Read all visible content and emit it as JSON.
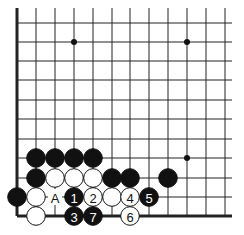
{
  "board": {
    "cols_x": [
      17,
      36,
      55,
      74,
      93,
      112,
      130,
      149,
      168,
      187,
      206,
      225
    ],
    "rows_y": [
      23,
      42,
      61,
      80,
      100,
      119,
      139,
      158,
      178,
      197,
      216
    ],
    "left_edge": true,
    "bottom_edge": true,
    "stone_radius": 9.3
  },
  "star_points": [
    {
      "x": 74,
      "y": 42
    },
    {
      "x": 187,
      "y": 42
    },
    {
      "x": 187,
      "y": 158
    }
  ],
  "stones": [
    {
      "color": "black",
      "col": 1,
      "row": 7,
      "label": ""
    },
    {
      "color": "black",
      "col": 2,
      "row": 7,
      "label": ""
    },
    {
      "color": "black",
      "col": 3,
      "row": 7,
      "label": ""
    },
    {
      "color": "black",
      "col": 4,
      "row": 7,
      "label": ""
    },
    {
      "color": "black",
      "col": 1,
      "row": 8,
      "label": ""
    },
    {
      "color": "white",
      "col": 2,
      "row": 8,
      "label": ""
    },
    {
      "color": "white",
      "col": 3,
      "row": 8,
      "label": ""
    },
    {
      "color": "white",
      "col": 4,
      "row": 8,
      "label": ""
    },
    {
      "color": "black",
      "col": 5,
      "row": 8,
      "label": ""
    },
    {
      "color": "black",
      "col": 6,
      "row": 8,
      "label": ""
    },
    {
      "color": "black",
      "col": 8,
      "row": 8,
      "label": ""
    },
    {
      "color": "black",
      "col": 0,
      "row": 9,
      "label": ""
    },
    {
      "color": "white",
      "col": 1,
      "row": 9,
      "label": ""
    },
    {
      "color": "black",
      "col": 3,
      "row": 9,
      "label": "1"
    },
    {
      "color": "white",
      "col": 4,
      "row": 9,
      "label": "2"
    },
    {
      "color": "white",
      "col": 5,
      "row": 9,
      "label": ""
    },
    {
      "color": "white",
      "col": 6,
      "row": 9,
      "label": "4"
    },
    {
      "color": "black",
      "col": 7,
      "row": 9,
      "label": "5"
    },
    {
      "color": "white",
      "col": 1,
      "row": 10,
      "label": ""
    },
    {
      "color": "black",
      "col": 3,
      "row": 10,
      "label": "3"
    },
    {
      "color": "black",
      "col": 4,
      "row": 10,
      "label": "7"
    },
    {
      "color": "white",
      "col": 6,
      "row": 10,
      "label": "6"
    }
  ],
  "markers": [
    {
      "col": 2,
      "row": 9,
      "text": "A"
    }
  ]
}
